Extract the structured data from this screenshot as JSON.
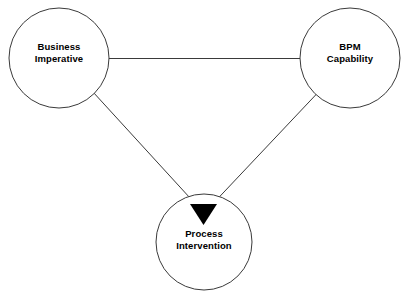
{
  "diagram": {
    "type": "triangle-relationship-diagram",
    "background_color": "#ffffff",
    "stroke_color": "#3a3a3a",
    "arrow_fill_color": "#000000",
    "text_color": "#000000",
    "nodes": [
      {
        "id": "business-imperative",
        "label_line1": "Business",
        "label_line2": "Imperative",
        "shape": "circle",
        "cx": 59,
        "cy": 58,
        "r": 50
      },
      {
        "id": "bpm-capability",
        "label_line1": "BPM",
        "label_line2": "Capability",
        "shape": "circle",
        "cx": 350,
        "cy": 58,
        "r": 50
      },
      {
        "id": "process-intervention",
        "label_line1": "Process",
        "label_line2": "Intervention",
        "shape": "circle",
        "cx": 204,
        "cy": 242,
        "r": 48
      }
    ],
    "edges": [
      {
        "id": "edge-business-to-bpm",
        "from": "business-imperative",
        "to": "bpm-capability",
        "arrow": false,
        "x1": 109,
        "y1": 58,
        "x2": 300,
        "y2": 58
      },
      {
        "id": "edge-business-to-process",
        "from": "business-imperative",
        "to": "process-intervention",
        "arrow": true,
        "x1": 93,
        "y1": 92,
        "x2": 200,
        "y2": 208
      },
      {
        "id": "edge-bpm-to-process",
        "from": "bpm-capability",
        "to": "process-intervention",
        "arrow": true,
        "x1": 317,
        "y1": 93,
        "x2": 208,
        "y2": 208
      }
    ],
    "arrowhead": {
      "id": "convergence-arrowhead",
      "shape": "filled-down-triangle",
      "points": "190,204 217,204 203.5,225",
      "fill": "#000000"
    }
  }
}
